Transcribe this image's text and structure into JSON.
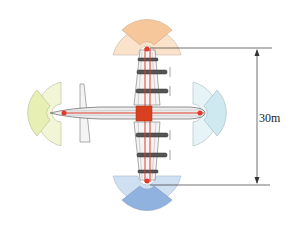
{
  "diagram": {
    "type": "aircraft-top-view-with-coverage-sectors",
    "dimension": {
      "label": "30m",
      "orientation": "vertical"
    },
    "sectors": [
      {
        "id": "top",
        "position": "wingtip-top",
        "colors": {
          "outer": "#f6c79a",
          "side": "#fbe3cb"
        }
      },
      {
        "id": "bottom",
        "position": "wingtip-bottom",
        "colors": {
          "outer": "#8fb2df",
          "side": "#cfe0f3"
        }
      },
      {
        "id": "left",
        "position": "tail",
        "colors": {
          "outer": "#e7efb4",
          "side": "#f2f6d6"
        }
      },
      {
        "id": "right",
        "position": "nose",
        "colors": {
          "outer": "#cfe9f1",
          "side": "#e6f4f8"
        }
      }
    ],
    "aircraft": {
      "fuselage_color": "#d9d9d9",
      "wiring_color": "#e03a2a",
      "center_block_color": "#d8401f",
      "engines_per_wing": 2
    }
  }
}
